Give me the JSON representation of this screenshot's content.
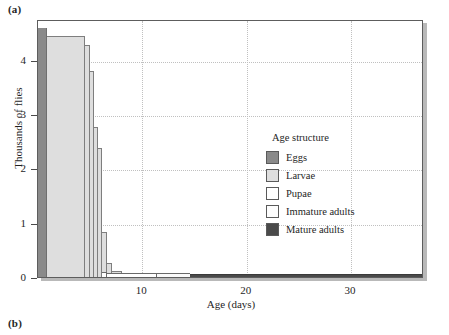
{
  "panels": {
    "a_label": "(a)",
    "b_label": "(b)"
  },
  "legend": {
    "title": "Age structure",
    "entries": [
      {
        "label": "Eggs",
        "color": "#8a8a8a",
        "swatch": "solid"
      },
      {
        "label": "Larvae",
        "color": "#dedede",
        "swatch": "solid"
      },
      {
        "label": "Pupae",
        "color": "#ffffff",
        "swatch": "solid"
      },
      {
        "label": "Immature adults",
        "color": "#fdfdfd",
        "swatch": "stipple"
      },
      {
        "label": "Mature adults",
        "color": "#4a4a4a",
        "swatch": "solid"
      }
    ]
  },
  "chart_data": {
    "type": "area",
    "title": "",
    "xlabel": "Age (days)",
    "ylabel": "Thousands of flies",
    "xlim": [
      0,
      37
    ],
    "ylim": [
      0,
      4.75
    ],
    "xticks": [
      10,
      20,
      30
    ],
    "yticks": [
      0,
      1,
      2,
      3,
      4
    ],
    "xtick_labels": [
      "10",
      "20",
      "30"
    ],
    "ytick_labels": [
      "0",
      "1",
      "2",
      "3",
      "4"
    ],
    "grid": "dotted both axes",
    "legend_position": "inside right-center",
    "stages": [
      {
        "name": "Eggs",
        "color": "#8a8a8a",
        "x_start": 0.0,
        "x_end": 0.85,
        "height": 4.62,
        "steps": [
          {
            "x0": 0.0,
            "x1": 0.85,
            "y": 4.62
          }
        ]
      },
      {
        "name": "Larvae",
        "color": "#dedede",
        "x_start": 0.85,
        "x_end": 8.1,
        "steps": [
          {
            "x0": 0.85,
            "x1": 4.55,
            "y": 4.47
          },
          {
            "x0": 4.55,
            "x1": 5.0,
            "y": 4.3
          },
          {
            "x0": 5.0,
            "x1": 5.35,
            "y": 3.83
          },
          {
            "x0": 5.35,
            "x1": 5.75,
            "y": 2.8
          },
          {
            "x0": 5.75,
            "x1": 6.15,
            "y": 2.42
          },
          {
            "x0": 6.15,
            "x1": 6.6,
            "y": 0.86
          },
          {
            "x0": 6.6,
            "x1": 7.1,
            "y": 0.3
          },
          {
            "x0": 7.1,
            "x1": 8.1,
            "y": 0.15
          }
        ]
      },
      {
        "name": "Pupae",
        "color": "#ffffff",
        "x_start": 6.15,
        "x_end": 11.4,
        "steps": [
          {
            "x0": 6.15,
            "x1": 6.6,
            "y": 0.12
          },
          {
            "x0": 6.6,
            "x1": 11.4,
            "y": 0.115
          }
        ]
      },
      {
        "name": "Immature adults",
        "color": "#fdfdfd",
        "x_start": 11.4,
        "x_end": 14.6,
        "steps": [
          {
            "x0": 11.4,
            "x1": 14.6,
            "y": 0.105
          }
        ]
      },
      {
        "name": "Mature adults",
        "color": "#4a4a4a",
        "x_start": 14.6,
        "x_end": 37.0,
        "steps": [
          {
            "x0": 14.6,
            "x1": 18.5,
            "y": 0.1
          },
          {
            "x0": 18.5,
            "x1": 37.0,
            "y": 0.085
          }
        ]
      }
    ]
  }
}
